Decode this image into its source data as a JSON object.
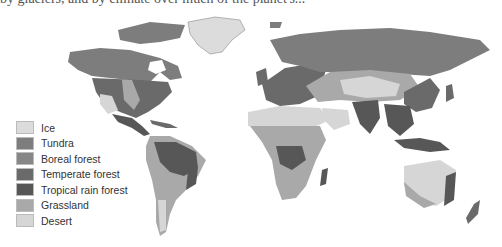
{
  "header": {
    "cropped_text": "by glaciers, and by climate over much of the planet's..."
  },
  "map": {
    "title": "World biomes map",
    "type": "choropleth"
  },
  "legend": {
    "items": [
      {
        "label": "Ice",
        "color": "#dcdcdc"
      },
      {
        "label": "Tundra",
        "color": "#7d7d7d"
      },
      {
        "label": "Boreal forest",
        "color": "#878787"
      },
      {
        "label": "Temperate forest",
        "color": "#6a6a6a"
      },
      {
        "label": "Tropical rain forest",
        "color": "#575757"
      },
      {
        "label": "Grassland",
        "color": "#a9a9a9"
      },
      {
        "label": "Desert",
        "color": "#d6d6d6"
      }
    ]
  },
  "colors": {
    "ice": "#dcdcdc",
    "tundra": "#7d7d7d",
    "boreal": "#878787",
    "temperate": "#6a6a6a",
    "tropical": "#575757",
    "grassland": "#a9a9a9",
    "desert": "#d6d6d6"
  }
}
